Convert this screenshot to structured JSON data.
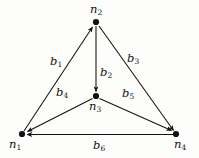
{
  "figure": {
    "background_color": "#fdfdfc",
    "stroke_color": "#111111",
    "node_fill_color": "#111111"
  },
  "graph_data": {
    "type": "directed-graph",
    "nodes": [
      {
        "id": "n1",
        "label": "n",
        "subscript": "1",
        "x": 22,
        "y": 134
      },
      {
        "id": "n2",
        "label": "n",
        "subscript": "2",
        "x": 96,
        "y": 22
      },
      {
        "id": "n3",
        "label": "n",
        "subscript": "3",
        "x": 96,
        "y": 96
      },
      {
        "id": "n4",
        "label": "n",
        "subscript": "4",
        "x": 176,
        "y": 134
      }
    ],
    "edges": [
      {
        "id": "b1",
        "label": "b",
        "subscript": "1",
        "from": "n1",
        "to": "n2",
        "directed": true
      },
      {
        "id": "b2",
        "label": "b",
        "subscript": "2",
        "from": "n2",
        "to": "n3",
        "directed": true
      },
      {
        "id": "b3",
        "label": "b",
        "subscript": "3",
        "from": "n2",
        "to": "n4",
        "directed": true
      },
      {
        "id": "b4",
        "label": "b",
        "subscript": "4",
        "from": "n3",
        "to": "n1",
        "directed": true
      },
      {
        "id": "b5",
        "label": "b",
        "subscript": "5",
        "from": "n3",
        "to": "n4",
        "directed": true
      },
      {
        "id": "b6",
        "label": "b",
        "subscript": "6",
        "from": "n4",
        "to": "n1",
        "directed": true
      }
    ]
  },
  "labels": {
    "n1": {
      "base": "n",
      "sub": "1"
    },
    "n2": {
      "base": "n",
      "sub": "2"
    },
    "n3": {
      "base": "n",
      "sub": "3"
    },
    "n4": {
      "base": "n",
      "sub": "4"
    },
    "b1": {
      "base": "b",
      "sub": "1"
    },
    "b2": {
      "base": "b",
      "sub": "2"
    },
    "b3": {
      "base": "b",
      "sub": "3"
    },
    "b4": {
      "base": "b",
      "sub": "4"
    },
    "b5": {
      "base": "b",
      "sub": "5"
    },
    "b6": {
      "base": "b",
      "sub": "6"
    }
  }
}
